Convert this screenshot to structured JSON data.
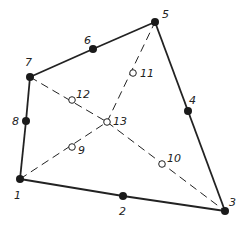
{
  "diagram": {
    "colors": {
      "line": "#222222",
      "node_fill": "#1a1a1a",
      "open_fill": "#ffffff"
    },
    "nodes": [
      {
        "id": "1",
        "x": 20,
        "y": 179,
        "type": "solid",
        "label": "1",
        "lx": 14,
        "ly": 199
      },
      {
        "id": "2",
        "x": 123,
        "y": 196,
        "type": "solid",
        "label": "2",
        "lx": 119,
        "ly": 215
      },
      {
        "id": "3",
        "x": 225,
        "y": 211,
        "type": "solid",
        "label": "3",
        "lx": 229,
        "ly": 206
      },
      {
        "id": "4",
        "x": 188,
        "y": 111,
        "type": "solid",
        "label": "4",
        "lx": 189,
        "ly": 104
      },
      {
        "id": "5",
        "x": 155,
        "y": 22,
        "type": "solid",
        "label": "5",
        "lx": 162,
        "ly": 18
      },
      {
        "id": "6",
        "x": 93,
        "y": 49,
        "type": "solid",
        "label": "6",
        "lx": 84,
        "ly": 44
      },
      {
        "id": "7",
        "x": 30,
        "y": 77,
        "type": "solid",
        "label": "7",
        "lx": 25,
        "ly": 66
      },
      {
        "id": "8",
        "x": 26,
        "y": 121,
        "type": "solid",
        "label": "8",
        "lx": 12,
        "ly": 125
      },
      {
        "id": "9",
        "x": 72,
        "y": 147,
        "type": "open",
        "label": "9",
        "lx": 78,
        "ly": 154
      },
      {
        "id": "10",
        "x": 162,
        "y": 164,
        "type": "open",
        "label": "10",
        "lx": 167,
        "ly": 162
      },
      {
        "id": "11",
        "x": 133,
        "y": 73,
        "type": "open",
        "label": "11",
        "lx": 140,
        "ly": 77
      },
      {
        "id": "12",
        "x": 72,
        "y": 100,
        "type": "open",
        "label": "12",
        "lx": 76,
        "ly": 98
      },
      {
        "id": "13",
        "x": 107,
        "y": 122,
        "type": "open",
        "label": "13",
        "lx": 113,
        "ly": 125
      }
    ],
    "solid_edges": [
      [
        "1",
        "2"
      ],
      [
        "2",
        "3"
      ],
      [
        "3",
        "4"
      ],
      [
        "4",
        "5"
      ],
      [
        "5",
        "6"
      ],
      [
        "6",
        "7"
      ],
      [
        "7",
        "8"
      ],
      [
        "8",
        "1"
      ]
    ],
    "dashed_edges": [
      [
        "1",
        "13"
      ],
      [
        "13",
        "5"
      ],
      [
        "7",
        "13"
      ],
      [
        "13",
        "3"
      ]
    ]
  }
}
